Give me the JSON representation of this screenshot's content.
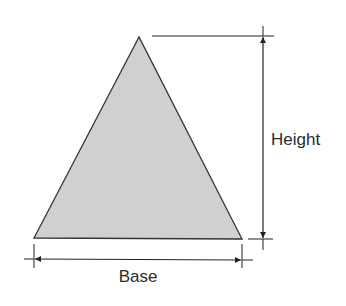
{
  "diagram": {
    "type": "triangle-dimensions",
    "shape": {
      "name": "triangle",
      "apex": [
        139,
        37
      ],
      "base_left": [
        34,
        238
      ],
      "base_right": [
        242,
        238
      ],
      "fill": "#d0d0d0",
      "stroke": "#333333"
    },
    "labels": {
      "height": "Height",
      "base": "Base"
    }
  }
}
